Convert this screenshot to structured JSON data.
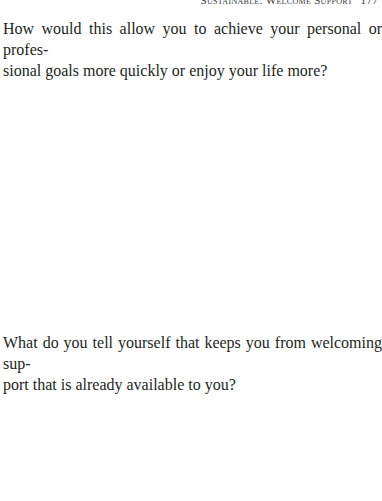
{
  "running_head": {
    "title": "Sustainable: Welcome Support",
    "page_number": "177"
  },
  "prompts": [
    {
      "lines": [
        "How would this allow you to achieve your personal or profes-",
        "sional goals more quickly or enjoy your life more?"
      ]
    },
    {
      "lines": [
        "What do you tell yourself that keeps you from welcoming sup-",
        "port that is already available to you?"
      ]
    }
  ]
}
